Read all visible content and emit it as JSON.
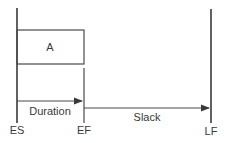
{
  "diagram": {
    "activity_label": "A",
    "markers": {
      "es": "ES",
      "ef": "EF",
      "lf": "LF"
    },
    "arrows": {
      "duration": "Duration",
      "slack": "Slack"
    },
    "colors": {
      "line": "#4a4a4a",
      "text": "#3a3a3a",
      "background": "#ffffff"
    }
  }
}
